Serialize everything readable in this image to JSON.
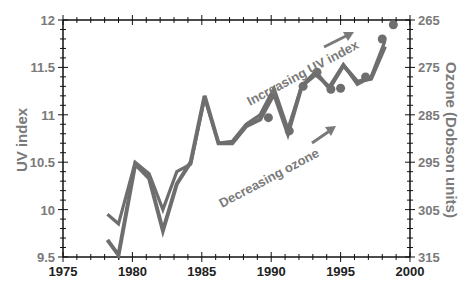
{
  "chart_data": {
    "type": "line",
    "title": "",
    "xlabel": "",
    "ylabel": "UV index",
    "ylabel_right": "Ozone (Dobson units)",
    "xlim": [
      1975,
      2000
    ],
    "ylim": [
      9.5,
      12
    ],
    "ylim_right": [
      315,
      265
    ],
    "x_ticks": [
      "1975",
      "1980",
      "1985",
      "1990",
      "1995",
      "2000"
    ],
    "y_ticks": [
      "9.5",
      "10",
      "10.5",
      "11",
      "11.5",
      "12"
    ],
    "y_ticks_right": [
      "265",
      "275",
      "285",
      "295",
      "305",
      "315"
    ],
    "grid": false,
    "series": [
      {
        "name": "UV index",
        "style": "line-with-markers",
        "x": [
          1978.2,
          1979.0,
          1980.2,
          1981.2,
          1982.2,
          1983.2,
          1984.2,
          1985.2,
          1986.2,
          1987.2,
          1988.2,
          1989.2,
          1990.2,
          1991.2,
          1992.2,
          1993.2,
          1994.2,
          1995.2,
          1996.2,
          1997.2,
          1998.2
        ],
        "values": [
          9.68,
          9.52,
          10.48,
          10.33,
          9.78,
          10.27,
          10.5,
          11.2,
          10.7,
          10.7,
          10.88,
          10.95,
          11.22,
          10.8,
          11.3,
          11.45,
          11.28,
          11.52,
          11.35,
          11.38,
          11.72
        ]
      },
      {
        "name": "Ozone",
        "style": "line",
        "x": [
          1978.2,
          1979.0,
          1980.2,
          1981.2,
          1982.2,
          1983.2,
          1984.2,
          1985.2,
          1986.2,
          1987.2,
          1988.2,
          1989.2,
          1990.2,
          1991.2,
          1992.2,
          1993.2,
          1994.2,
          1995.2,
          1996.2,
          1997.2,
          1998.2
        ],
        "values": [
          9.95,
          9.85,
          10.5,
          10.38,
          10.0,
          10.4,
          10.48,
          11.18,
          10.7,
          10.72,
          10.9,
          11.0,
          11.28,
          10.85,
          11.3,
          11.42,
          11.3,
          11.53,
          11.32,
          11.4,
          11.78
        ]
      },
      {
        "name": "UV index markers",
        "style": "markers",
        "x": [
          1989.8,
          1991.3,
          1992.3,
          1993.3,
          1994.3,
          1995.0,
          1996.8,
          1998.0,
          1998.8
        ],
        "values": [
          10.97,
          10.83,
          11.3,
          11.45,
          11.27,
          11.28,
          11.4,
          11.8,
          11.95
        ]
      }
    ],
    "annotations": [
      "Increasing UV index",
      "Decreasing ozone"
    ]
  }
}
